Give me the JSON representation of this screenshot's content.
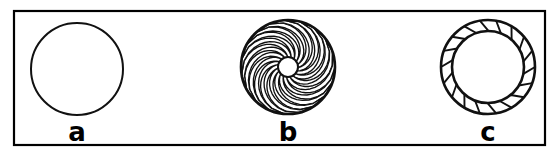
{
  "figure": {
    "background_color": "#ffffff",
    "line_color": "#111111",
    "frame": {
      "x": 14,
      "y": 11,
      "width": 531,
      "height": 134,
      "stroke_width": 2.2
    },
    "panels": [
      {
        "id": "panel-a",
        "caption": "a",
        "type": "plain-circle",
        "center_x": 77,
        "center_y": 69,
        "outer_radius": 46,
        "inner_radius": 0,
        "element_count": 0,
        "caption_x": 77,
        "caption_y": 141,
        "description": "open circular duct cross-section, no internal elements"
      },
      {
        "id": "panel-b",
        "caption": "b",
        "type": "curved-blade-swirler",
        "center_x": 288,
        "center_y": 67,
        "outer_radius": 47,
        "inner_radius": 10,
        "element_count": 19,
        "caption_x": 288,
        "caption_y": 141,
        "description": "axial swirler with curved blades spiralling inward to a small central hub"
      },
      {
        "id": "panel-c",
        "caption": "c",
        "type": "annular-vane-ring",
        "center_x": 488,
        "center_y": 67,
        "outer_radius": 47,
        "inner_radius": 36,
        "element_count": 18,
        "caption_x": 488,
        "caption_y": 141,
        "description": "annular ring of short inclined guide vanes around an open core"
      }
    ],
    "captions": [
      "a",
      "b",
      "c"
    ]
  }
}
